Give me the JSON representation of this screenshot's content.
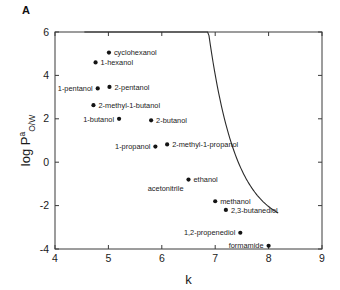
{
  "panel": {
    "label": "A"
  },
  "chart_data": {
    "type": "scatter",
    "title": "",
    "xlabel": "k",
    "ylabel": "log P",
    "ylabel_superscript": "a",
    "ylabel_subscript": "O/W",
    "xlim": [
      4,
      9
    ],
    "ylim": [
      -4,
      6
    ],
    "xticks": [
      4,
      5,
      6,
      7,
      8,
      9
    ],
    "yticks": [
      6,
      4,
      2,
      0,
      -2,
      -4
    ],
    "xtick_labels": [
      "4",
      "5",
      "6",
      "7",
      "8",
      "9"
    ],
    "ytick_labels": [
      "6",
      "4",
      "2",
      "0",
      "-2",
      "-4"
    ],
    "grid": false,
    "legend": "none",
    "points": [
      {
        "name": "cyclohexanol",
        "x": 5.01,
        "y": 5.05,
        "label_side": "right"
      },
      {
        "name": "1-hexanol",
        "x": 4.76,
        "y": 4.6,
        "label_side": "right"
      },
      {
        "name": "1-pentanol",
        "x": 4.8,
        "y": 3.4,
        "label_side": "left"
      },
      {
        "name": "2-pentanol",
        "x": 5.02,
        "y": 3.47,
        "label_side": "right"
      },
      {
        "name": "2-methyl-1-butanol",
        "x": 4.72,
        "y": 2.63,
        "label_side": "right"
      },
      {
        "name": "1-butanol",
        "x": 5.2,
        "y": 2.0,
        "label_side": "left"
      },
      {
        "name": "2-butanol",
        "x": 5.8,
        "y": 1.93,
        "label_side": "right"
      },
      {
        "name": "1-propanol",
        "x": 5.88,
        "y": 0.72,
        "label_side": "left"
      },
      {
        "name": "2-methyl-1-propanol",
        "x": 6.1,
        "y": 0.82,
        "label_side": "right"
      },
      {
        "name": "ethanol",
        "x": 6.5,
        "y": -0.8,
        "label_side": "right"
      },
      {
        "name": "acetonitrile",
        "x": 6.5,
        "y": -0.8,
        "label_side": "belowleft"
      },
      {
        "name": "methanol",
        "x": 7.0,
        "y": -1.8,
        "label_side": "right"
      },
      {
        "name": "2,3-butanediol",
        "x": 7.2,
        "y": -2.2,
        "label_side": "right"
      },
      {
        "name": "1,2-propenediol",
        "x": 7.47,
        "y": -3.25,
        "label_side": "left"
      },
      {
        "name": "formamide",
        "x": 8.0,
        "y": -3.85,
        "label_side": "left"
      }
    ],
    "fit_curve": {
      "description": "monotonically decreasing fitted trend line",
      "x_start": 4.55,
      "x_end": 8.18,
      "y_start": 6.0,
      "y_end": -4.3
    }
  }
}
